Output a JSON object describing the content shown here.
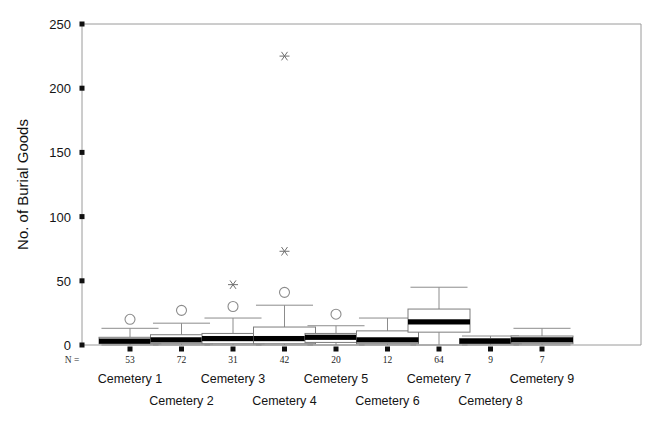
{
  "chart_data": {
    "type": "box",
    "title": "",
    "xlabel": "",
    "ylabel": "No. of Burial Goods",
    "ylim": [
      0,
      250
    ],
    "yticks": [
      0,
      50,
      100,
      150,
      200,
      250
    ],
    "ytick_labels": [
      "0",
      "50",
      "100",
      "150",
      "200",
      "250"
    ],
    "grid": false,
    "legend": "none",
    "n_legend_label": "N =",
    "categories": [
      "Cemetery 1",
      "Cemetery 2",
      "Cemetery 3",
      "Cemetery 4",
      "Cemetery 5",
      "Cemetery 6",
      "Cemetery 7",
      "Cemetery 8",
      "Cemetery 9"
    ],
    "n_values": [
      53,
      72,
      31,
      42,
      20,
      12,
      64,
      9,
      7
    ],
    "boxes": [
      {
        "category": "Cemetery 1",
        "n": 53,
        "whisker_low": 0,
        "q1": 1,
        "median": 3,
        "q3": 6,
        "whisker_high": 13,
        "outliers_circle": [
          20
        ],
        "outliers_star": []
      },
      {
        "category": "Cemetery 2",
        "n": 72,
        "whisker_low": 0,
        "q1": 1,
        "median": 4,
        "q3": 8,
        "whisker_high": 17,
        "outliers_circle": [
          27
        ],
        "outliers_star": []
      },
      {
        "category": "Cemetery 3",
        "n": 31,
        "whisker_low": 0,
        "q1": 1,
        "median": 5,
        "q3": 9,
        "whisker_high": 21,
        "outliers_circle": [
          30
        ],
        "outliers_star": [
          47
        ]
      },
      {
        "category": "Cemetery 4",
        "n": 42,
        "whisker_low": 0,
        "q1": 1,
        "median": 5,
        "q3": 14,
        "whisker_high": 31,
        "outliers_circle": [
          41
        ],
        "outliers_star": [
          73,
          225
        ]
      },
      {
        "category": "Cemetery 5",
        "n": 20,
        "whisker_low": 0,
        "q1": 2,
        "median": 6,
        "q3": 9,
        "whisker_high": 15,
        "outliers_circle": [
          24
        ],
        "outliers_star": []
      },
      {
        "category": "Cemetery 6",
        "n": 12,
        "whisker_low": 0,
        "q1": 1,
        "median": 4,
        "q3": 11,
        "whisker_high": 21,
        "outliers_circle": [],
        "outliers_star": []
      },
      {
        "category": "Cemetery 7",
        "n": 64,
        "whisker_low": 0,
        "q1": 10,
        "median": 18,
        "q3": 28,
        "whisker_high": 45,
        "outliers_circle": [],
        "outliers_star": []
      },
      {
        "category": "Cemetery 8",
        "n": 9,
        "whisker_low": 0,
        "q1": 1,
        "median": 3,
        "q3": 5,
        "whisker_high": 7,
        "outliers_circle": [],
        "outliers_star": []
      },
      {
        "category": "Cemetery 9",
        "n": 7,
        "whisker_low": 0,
        "q1": 1,
        "median": 4,
        "q3": 7,
        "whisker_high": 13,
        "outliers_circle": [],
        "outliers_star": []
      }
    ]
  },
  "colors": {
    "background": "#ffffff",
    "axis": "#9a9a9a",
    "box_stroke": "#7d7d7d",
    "median": "#000000",
    "whisker": "#8c8c8c",
    "outlier": "#8c8c8c",
    "text": "#141414"
  }
}
